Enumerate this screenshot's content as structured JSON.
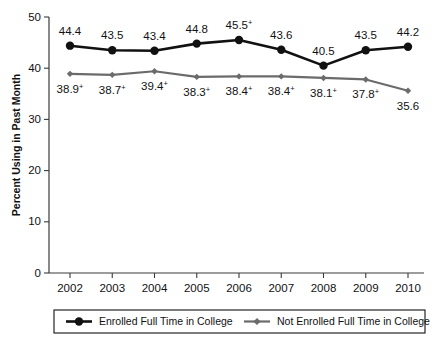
{
  "chart_data": {
    "type": "line",
    "title": "",
    "xlabel": "",
    "ylabel": "Percent Using in Past Month",
    "categories": [
      "2002",
      "2003",
      "2004",
      "2005",
      "2006",
      "2007",
      "2008",
      "2009",
      "2010"
    ],
    "ylim": [
      0,
      50
    ],
    "yticks": [
      0,
      10,
      20,
      30,
      40,
      50
    ],
    "ytick_labels": [
      "0",
      "10",
      "20",
      "30",
      "40",
      "50"
    ],
    "grid": false,
    "legend_position": "bottom",
    "series": [
      {
        "name": "Enrolled Full Time in College",
        "color": "#111111",
        "marker": "circle",
        "values": [
          44.4,
          43.5,
          43.4,
          44.8,
          45.5,
          43.6,
          40.5,
          43.5,
          44.2
        ],
        "labels": [
          "44.4",
          "43.5",
          "43.4",
          "44.8",
          "45.5",
          "43.6",
          "40.5",
          "43.5",
          "44.2"
        ],
        "significance": [
          false,
          false,
          false,
          false,
          true,
          false,
          false,
          false,
          false
        ]
      },
      {
        "name": "Not Enrolled Full Time in College",
        "color": "#6b6b6b",
        "marker": "diamond",
        "values": [
          38.9,
          38.7,
          39.4,
          38.3,
          38.4,
          38.4,
          38.1,
          37.8,
          35.6
        ],
        "labels": [
          "38.9",
          "38.7",
          "39.4",
          "38.3",
          "38.4",
          "38.4",
          "38.1",
          "37.8",
          "35.6"
        ],
        "significance": [
          true,
          true,
          true,
          true,
          true,
          true,
          true,
          true,
          false
        ]
      }
    ],
    "significance_marker": "+"
  },
  "legend": {
    "items": [
      {
        "label": "Enrolled Full Time in College"
      },
      {
        "label": "Not Enrolled Full Time in College"
      }
    ]
  }
}
